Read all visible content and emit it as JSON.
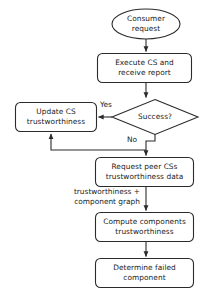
{
  "diagram": {
    "stroke_color": "#2b2b2b",
    "fill_color": "#ffffff",
    "text_color": "#1a1a1a",
    "nodes": [
      {
        "id": "consumer-request",
        "shape": "ellipse",
        "lines": [
          "Consumer",
          "request"
        ]
      },
      {
        "id": "execute-cs",
        "shape": "rounded-rect",
        "lines": [
          "Execute CS and",
          "receive report"
        ]
      },
      {
        "id": "success-decision",
        "shape": "diamond",
        "lines": [
          "Success?"
        ]
      },
      {
        "id": "update-cs",
        "shape": "rounded-rect",
        "lines": [
          "Update CS",
          "trustworthiness"
        ]
      },
      {
        "id": "request-peer",
        "shape": "rounded-rect",
        "lines": [
          "Request peer CSs",
          "trustworthiness data"
        ]
      },
      {
        "id": "compute-components",
        "shape": "rounded-rect",
        "lines": [
          "Compute components",
          "trustworthiness"
        ]
      },
      {
        "id": "determine-failed",
        "shape": "rounded-rect",
        "lines": [
          "Determine failed",
          "component"
        ]
      }
    ],
    "edge_labels": {
      "yes": "Yes",
      "no": "No",
      "data_flow_line1": "trustworthiness +",
      "data_flow_line2": "component graph"
    }
  }
}
